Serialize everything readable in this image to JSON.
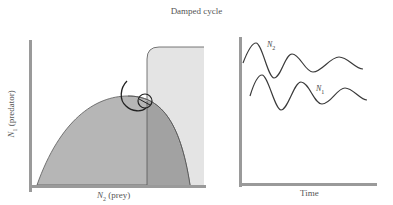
{
  "title": "Damped cycle",
  "left_panel": {
    "name": "phase-plane",
    "y_axis_label": {
      "symbol": "N",
      "subscript": "1",
      "text": " (predator)"
    },
    "x_axis_label": {
      "symbol": "N",
      "subscript": "2",
      "text": " (prey)"
    },
    "regions": [
      {
        "name": "prey-isocline-hump",
        "shape": "parabola",
        "fill": "#b4b4b4"
      },
      {
        "name": "predator-isocline-region",
        "shape": "rounded-rect",
        "fill": "#e6e6e6"
      },
      {
        "name": "overlap-region",
        "fill": "#a0a0a0"
      }
    ],
    "trajectory": "inward spiral converging near isocline intersection"
  },
  "right_panel": {
    "name": "time-series",
    "x_axis_label": "Time",
    "series": [
      {
        "name": "N2",
        "symbol": "N",
        "subscript": "2",
        "description": "prey, damped oscillation"
      },
      {
        "name": "N1",
        "symbol": "N",
        "subscript": "1",
        "description": "predator, damped oscillation, lagged"
      }
    ]
  },
  "colors": {
    "axis": "#9a9a9a",
    "curve": "#3a3a3a",
    "hump_fill": "#b6b6b6",
    "region_fill": "#e4e4e4",
    "overlap_fill": "#a2a2a2",
    "text": "#555555"
  }
}
